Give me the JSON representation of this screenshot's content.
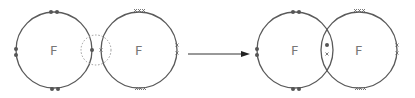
{
  "diagram": {
    "colors": {
      "ring": "#5a5a5a",
      "electron_dot": "#555555",
      "electron_cross": "#6a6a6a",
      "label": "#777777",
      "arrow": "#222222"
    },
    "before": {
      "atoms": [
        {
          "symbol": "F",
          "electron_marker": "dot",
          "center": [
            54,
            50
          ],
          "radius": 38
        },
        {
          "symbol": "F",
          "electron_marker": "cross",
          "center": [
            139,
            50
          ],
          "radius": 38
        }
      ],
      "overlap_highlight": {
        "style": "dashed-circle",
        "center": [
          96,
          50
        ],
        "radius": 15
      }
    },
    "arrow": {
      "from": [
        188,
        54
      ],
      "to": [
        250,
        54
      ]
    },
    "after": {
      "atoms": [
        {
          "symbol": "F",
          "electron_marker": "dot",
          "center": [
            295,
            50
          ],
          "radius": 38
        },
        {
          "symbol": "F",
          "electron_marker": "cross",
          "center": [
            359,
            50
          ],
          "radius": 38
        }
      ],
      "shared_pair": [
        "dot",
        "cross"
      ]
    }
  }
}
